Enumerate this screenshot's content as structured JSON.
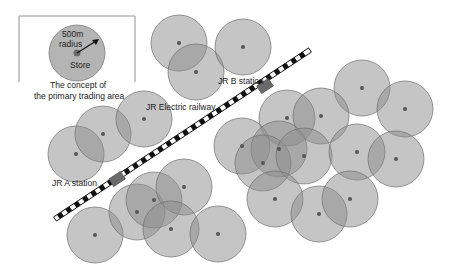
{
  "legend": {
    "box": {
      "x": 19,
      "y": 16,
      "w": 116,
      "h": 76
    },
    "circle": {
      "cx": 77,
      "cy": 53,
      "r": 28
    },
    "radius_label_line1": "500m",
    "radius_label_line2": "radius",
    "store_label": "Store",
    "caption_line1": "The concept of",
    "caption_line2": "the primary trading area"
  },
  "railway": {
    "label": "JR Electric railway",
    "start": {
      "x": 55,
      "y": 219
    },
    "end": {
      "x": 310,
      "y": 50
    }
  },
  "stations": [
    {
      "label": "JR A station",
      "x": 117,
      "y": 179
    },
    {
      "label": "JR B station",
      "x": 265,
      "y": 86
    }
  ],
  "colors": {
    "circle_fill": "#8c8c8c",
    "circle_stroke": "#6e6e6e",
    "store_dot": "#555555",
    "station": "#6a6a6a"
  },
  "trading_area_radius": 28,
  "stores": [
    {
      "x": 76,
      "y": 154
    },
    {
      "x": 103,
      "y": 134
    },
    {
      "x": 144,
      "y": 119
    },
    {
      "x": 179,
      "y": 43
    },
    {
      "x": 196,
      "y": 72
    },
    {
      "x": 243,
      "y": 47
    },
    {
      "x": 95,
      "y": 235
    },
    {
      "x": 137,
      "y": 212
    },
    {
      "x": 154,
      "y": 200
    },
    {
      "x": 184,
      "y": 187
    },
    {
      "x": 171,
      "y": 229
    },
    {
      "x": 218,
      "y": 234
    },
    {
      "x": 362,
      "y": 88
    },
    {
      "x": 405,
      "y": 109
    },
    {
      "x": 287,
      "y": 118
    },
    {
      "x": 321,
      "y": 116
    },
    {
      "x": 242,
      "y": 146
    },
    {
      "x": 279,
      "y": 149
    },
    {
      "x": 263,
      "y": 163
    },
    {
      "x": 304,
      "y": 156
    },
    {
      "x": 357,
      "y": 152
    },
    {
      "x": 396,
      "y": 159
    },
    {
      "x": 275,
      "y": 199
    },
    {
      "x": 319,
      "y": 214
    },
    {
      "x": 350,
      "y": 199
    }
  ]
}
